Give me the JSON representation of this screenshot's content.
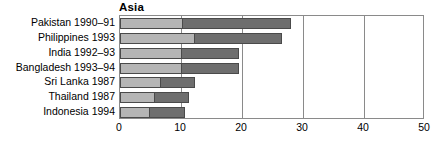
{
  "chart_data": {
    "type": "bar",
    "orientation": "horizontal",
    "stacked": true,
    "title": "Asia",
    "xlabel": "",
    "ylabel": "",
    "xlim": [
      0,
      50
    ],
    "xticks": [
      0,
      10,
      20,
      30,
      40,
      50
    ],
    "xtick_labels": [
      "0",
      "10",
      "20",
      "30",
      "40",
      "50"
    ],
    "grid": true,
    "grid_axis": "x",
    "legend": null,
    "categories": [
      "Pakistan 1990–91",
      "Philippines 1993",
      "India 1992–93",
      "Bangladesh 1993–94",
      "Sri Lanka 1987",
      "Thailand 1987",
      "Indonesia 1994"
    ],
    "series": [
      {
        "name": "segment-1",
        "color": "#b5b5b5",
        "values": [
          10.1,
          12.2,
          10.0,
          10.0,
          6.6,
          5.5,
          4.7
        ]
      },
      {
        "name": "segment-2",
        "color": "#6e6e6e",
        "values": [
          17.9,
          14.3,
          9.5,
          9.5,
          5.7,
          5.8,
          5.9
        ]
      }
    ],
    "totals": [
      28.0,
      26.5,
      19.5,
      19.5,
      12.3,
      11.3,
      10.6
    ]
  },
  "style": {
    "segment_1_color": "#b5b5b5",
    "segment_2_color": "#6e6e6e",
    "bar_outline_color": "#4a4a4a",
    "axis_color": "#8a8a8a",
    "text_color": "#000000",
    "background": "#ffffff"
  }
}
